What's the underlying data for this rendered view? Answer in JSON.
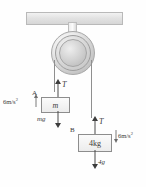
{
  "figure": {
    "support": {
      "name": "ceiling-beam"
    },
    "pulley": {
      "name": "pulley"
    },
    "blocks": [
      {
        "id": "A",
        "label": "A",
        "mass_text": "m",
        "weight_label": "mg",
        "tension_label": "T",
        "acceleration_text": "6m/s",
        "acceleration_exponent": "2",
        "acceleration_direction": "up"
      },
      {
        "id": "B",
        "label": "B",
        "mass_text": "4kg",
        "weight_label": "4g",
        "tension_label": "T",
        "acceleration_text": "6m/s",
        "acceleration_exponent": "2",
        "acceleration_direction": "down"
      }
    ],
    "colors": {
      "stroke": "#8d8d8d",
      "arrow": "#3c3c3c",
      "cord": "#8f8f8f",
      "beam_fill": "#e3e3e3",
      "text": "#3a3a3a"
    }
  }
}
